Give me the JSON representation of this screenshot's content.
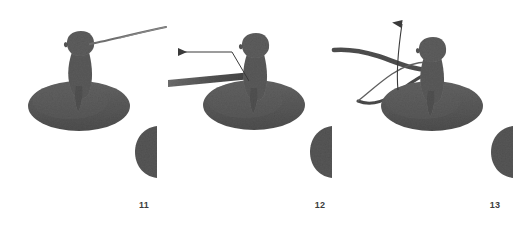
{
  "figure": {
    "background_color": "#ffffff",
    "width": 529,
    "height": 237,
    "panel_count": 3
  },
  "colors": {
    "subject_fill": "#5a5a5a",
    "subject_fill_light": "#6a6a6a",
    "disc_fill": "#585858",
    "half_disc_fill": "#565656",
    "filament_dark": "#4a4a4a",
    "filament_thin": "#6f6f6f",
    "annotation_arrow": "#3a3a3a",
    "caption_text": "#3c3c3c",
    "background": "#ffffff"
  },
  "panels": [
    {
      "id": "panel-11",
      "caption": "11",
      "caption_position": {
        "x": 124,
        "y": 200
      },
      "subject": {
        "name": "bird-silhouette",
        "head_center": {
          "x": 80,
          "y": 45
        },
        "body_center": {
          "x": 81,
          "y": 72
        },
        "disc": {
          "cx": 79,
          "cy": 106,
          "rx": 51,
          "ry": 25
        }
      },
      "filament": {
        "name": "thin-filament",
        "description": "thin tapering line rising to upper right from beak",
        "start": {
          "x": 90,
          "y": 44
        },
        "end": {
          "x": 166,
          "y": 27
        }
      },
      "half_disc": {
        "name": "half-disc-marker",
        "cx": 157,
        "cy": 152,
        "rx": 22,
        "ry": 26
      },
      "annotation_arrow": null
    },
    {
      "id": "panel-12",
      "caption": "12",
      "caption_position": {
        "x": 300,
        "y": 200
      },
      "subject": {
        "name": "bird-silhouette",
        "head_center": {
          "x": 255,
          "y": 47
        },
        "body_center": {
          "x": 256,
          "y": 74
        },
        "disc": {
          "cx": 254,
          "cy": 105,
          "rx": 51,
          "ry": 25
        }
      },
      "filament": {
        "name": "thick-filament",
        "description": "thick tapered dark bar extending horizontally to the left",
        "start": {
          "x": 248,
          "y": 73
        },
        "end": {
          "x": 166,
          "y": 84
        }
      },
      "half_disc": {
        "name": "half-disc-marker",
        "cx": 332,
        "cy": 152,
        "rx": 22,
        "ry": 26
      },
      "annotation_arrow": {
        "name": "leftward-annotation-arrow",
        "direction": "left",
        "tip": {
          "x": 172,
          "y": 52
        },
        "tail": {
          "x": 232,
          "y": 52
        },
        "leader_end": {
          "x": 248,
          "y": 80
        }
      }
    },
    {
      "id": "panel-13",
      "caption": "13",
      "caption_position": {
        "x": 475,
        "y": 200
      },
      "subject": {
        "name": "bird-silhouette",
        "head_center": {
          "x": 432,
          "y": 51
        },
        "body_center": {
          "x": 433,
          "y": 76
        },
        "disc": {
          "cx": 432,
          "cy": 106,
          "rx": 51,
          "ry": 25
        }
      },
      "filament": {
        "name": "curved-thick-filament",
        "description": "thick filament curving from beak down-left then hooking up to the left",
        "start": {
          "x": 430,
          "y": 68
        },
        "end": {
          "x": 334,
          "y": 51
        }
      },
      "half_disc": {
        "name": "half-disc-marker",
        "cx": 510,
        "cy": 152,
        "rx": 22,
        "ry": 26
      },
      "annotation_arrow": {
        "name": "upward-annotation-arrow",
        "direction": "up",
        "tip": {
          "x": 402,
          "y": 14
        },
        "tail": {
          "x": 398,
          "y": 88
        },
        "curved": true
      }
    }
  ],
  "half_disc_markers": [
    {
      "name": "half-disc-left",
      "cx": 157,
      "cy": 152
    },
    {
      "name": "half-disc-middle",
      "cx": 332,
      "cy": 152
    },
    {
      "name": "half-disc-right",
      "cx": 510,
      "cy": 152
    }
  ]
}
